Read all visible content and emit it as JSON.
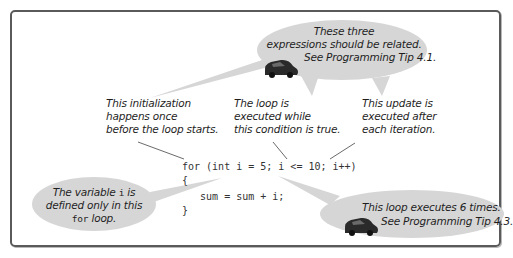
{
  "colors": {
    "frame_border": "#5a5a5a",
    "bubble_fill": "#d6d6d6",
    "text": "#1e1e1e",
    "code_text": "#333333",
    "pointer_line": "#444444"
  },
  "callouts": {
    "initialization": {
      "line1": "This initialization",
      "line2": "happens once",
      "line3": "before the loop starts."
    },
    "condition": {
      "line1": "The loop is",
      "line2": "executed while",
      "line3": "this condition is true."
    },
    "update": {
      "line1": "This update is",
      "line2": "executed after",
      "line3": "each iteration."
    }
  },
  "bubbles": {
    "top": {
      "line1": "These three",
      "line2": "expressions should be related.",
      "line3": "See Programming Tip 4.1.",
      "icon": "car-icon"
    },
    "left": {
      "line1_prefix": "The variable",
      "line1_code": "i",
      "line1_suffix": "is",
      "line2": "defined only in this",
      "line3_code": "for",
      "line3_suffix": "loop."
    },
    "bottom_right": {
      "line1": "This loop executes 6 times.",
      "line2": "See Programming Tip 4.3.",
      "icon": "car-icon"
    }
  },
  "code": {
    "lines": [
      "for (int i = 5; i <= 10; i++)",
      "{",
      "   sum = sum + i;",
      "}"
    ]
  }
}
